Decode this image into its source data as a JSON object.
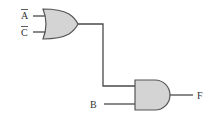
{
  "diagram": {
    "type": "logic-circuit",
    "inputs": [
      {
        "id": "A",
        "label": "A",
        "negated": true
      },
      {
        "id": "C",
        "label": "C",
        "negated": true
      },
      {
        "id": "B",
        "label": "B",
        "negated": false
      }
    ],
    "gates": [
      {
        "id": "g1",
        "type": "OR",
        "inputs": [
          "A̅",
          "C̅"
        ]
      },
      {
        "id": "g2",
        "type": "AND",
        "inputs": [
          "g1",
          "B"
        ]
      }
    ],
    "output": {
      "label": "F"
    },
    "expression": "F = (A̅ + C̅) · B"
  },
  "colors": {
    "gate_fill": "#d4d4d4",
    "gate_stroke": "#555555",
    "wire": "#4a4a4a",
    "text": "#333333"
  }
}
